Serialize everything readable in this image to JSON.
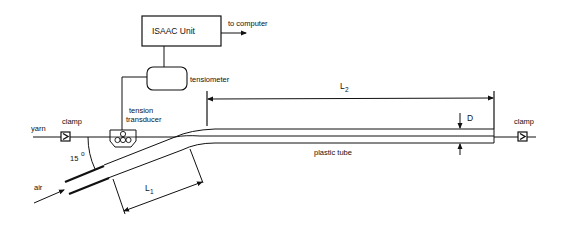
{
  "diagram": {
    "type": "experimental apparatus schematic",
    "labels": {
      "isaac_unit": "ISAAC Unit",
      "to_computer": "to computer",
      "tensiometer": "tensiometer",
      "tension_line1": "tension",
      "tension_line2": "transducer",
      "yarn": "yarn",
      "clamp_left": "clamp",
      "clamp_right": "clamp",
      "angle": "15",
      "angle_unit": "o",
      "air": "air",
      "l1_main": "L",
      "l1_sub": "1",
      "l2_main": "L",
      "l2_sub": "2",
      "diameter": "D",
      "plastic_tube": "plastic tube"
    },
    "colors": {
      "ink": "#111111",
      "background": "#ffffff"
    }
  }
}
